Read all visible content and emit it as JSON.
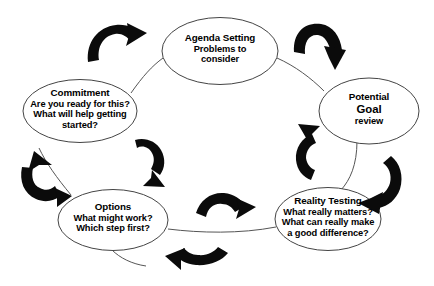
{
  "diagram": {
    "type": "cycle",
    "background_color": "#ffffff",
    "arrow_color": "#0b0b0b",
    "node_stroke_color": "#444444",
    "node_fill_color": "#ffffff",
    "connector_color": "#555555",
    "nodes": [
      {
        "id": "agenda-setting",
        "heading": "Agenda Setting",
        "lines": [
          "Problems to",
          "consider"
        ],
        "emphasis": ""
      },
      {
        "id": "potential-goal",
        "heading": "Potential",
        "lines": [
          "Goal",
          "review"
        ],
        "emphasis": "Goal"
      },
      {
        "id": "reality-testing",
        "heading": "Reality Testing",
        "lines": [
          "What really matters?",
          "What can really make",
          "a good difference?"
        ],
        "emphasis": ""
      },
      {
        "id": "options",
        "heading": "Options",
        "lines": [
          "What might work?",
          "Which step first?"
        ],
        "emphasis": ""
      },
      {
        "id": "commitment",
        "heading": "Commitment",
        "lines": [
          "Are you ready for this?",
          "What will help getting",
          "started?"
        ],
        "emphasis": ""
      }
    ],
    "arrows": [
      {
        "id": "arrow-top-left",
        "name": "curved-arrow-up-right-icon",
        "direction": "up-right"
      },
      {
        "id": "arrow-top-right",
        "name": "curved-arrow-down-right-icon",
        "direction": "down-right"
      },
      {
        "id": "arrow-right",
        "name": "curved-arrow-down-left-icon",
        "direction": "down-left"
      },
      {
        "id": "arrow-bottom",
        "name": "curved-arrow-left-icon",
        "direction": "left"
      },
      {
        "id": "arrow-left",
        "name": "curved-arrow-up-icon",
        "direction": "up"
      },
      {
        "id": "arrow-inner-upper-left",
        "name": "curved-arrow-down-icon",
        "direction": "down"
      },
      {
        "id": "arrow-inner-lower-center",
        "name": "curved-arrow-right-icon",
        "direction": "right"
      },
      {
        "id": "arrow-inner-right",
        "name": "curved-arrow-up-left-icon",
        "direction": "up-left"
      }
    ]
  }
}
